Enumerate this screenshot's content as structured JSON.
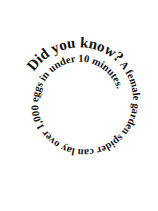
{
  "spiral": {
    "heading": "Did you know?",
    "fact": " A female garden spider can lay over 1,000 eggs in under 10 minutes.",
    "text_color": "#111111",
    "background": "#ffffff"
  }
}
